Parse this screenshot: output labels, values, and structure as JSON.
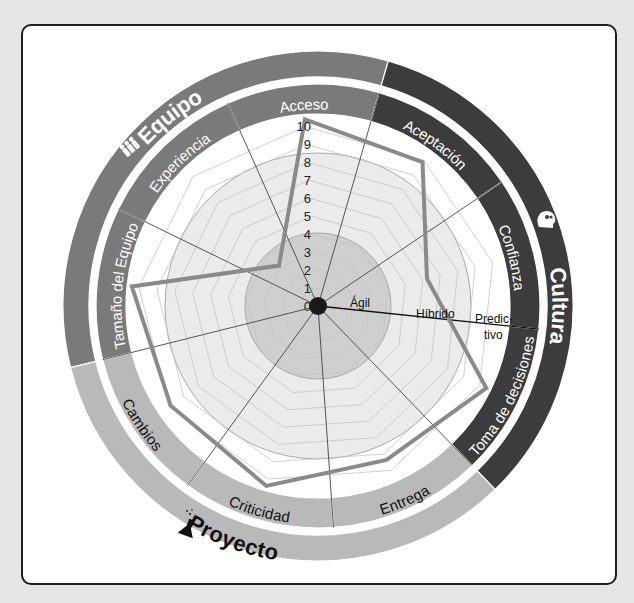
{
  "chart_data": {
    "type": "radar",
    "title": "",
    "scale": {
      "min": 0,
      "max": 10,
      "ticks": [
        0,
        1,
        2,
        3,
        4,
        5,
        6,
        7,
        8,
        9,
        10
      ]
    },
    "axes": [
      "Acceso",
      "Aceptación",
      "Confianza",
      "Toma de decisiones",
      "Entrega",
      "Criticidad",
      "Cambios",
      "Tamaño del Equipo",
      "Experiencia"
    ],
    "series": [
      {
        "name": "Evaluación",
        "values": [
          10,
          9.5,
          6,
          10,
          9,
          10,
          9.5,
          10,
          3
        ]
      }
    ],
    "zones": [
      {
        "label": "Ágil",
        "from": 0,
        "to": 4
      },
      {
        "label": "Híbrido",
        "from": 4,
        "to": 8.5
      },
      {
        "label": "Predic-\ntivo",
        "from": 8.5,
        "to": 10
      }
    ],
    "groups": [
      {
        "label": "Equipo",
        "icon": "people-icon",
        "axes": [
          "Experiencia",
          "Acceso",
          "Tamaño del Equipo"
        ],
        "color": "#7a7a7a",
        "text_color": "#ffffff"
      },
      {
        "label": "Cultura",
        "icon": "head-gears-icon",
        "axes": [
          "Aceptación",
          "Confianza",
          "Toma de decisiones"
        ],
        "color": "#3c3c3c",
        "text_color": "#ffffff"
      },
      {
        "label": "Proyecto",
        "icon": "flask-icon",
        "axes": [
          "Entrega",
          "Criticidad",
          "Cambios"
        ],
        "color": "#b9b9b9",
        "text_color": "#111111"
      }
    ]
  },
  "labels": {
    "ticks": [
      "0",
      "1",
      "2",
      "3",
      "4",
      "5",
      "6",
      "7",
      "8",
      "9",
      "10"
    ],
    "zone_agil": "Ágil",
    "zone_hibrido": "Híbrido",
    "zone_predictivo_1": "Predic-",
    "zone_predictivo_2": "tivo",
    "group_equipo": "Equipo",
    "group_cultura": "Cultura",
    "group_proyecto": "Proyecto"
  },
  "colors": {
    "line": "#8a8a8a",
    "inner_zone": "#cfcfcf",
    "mid_zone": "#ebebeb",
    "grid": "#c4c4c4",
    "spoke": "#444444",
    "center_dot": "#1a1a1a"
  }
}
